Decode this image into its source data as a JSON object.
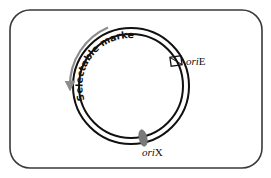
{
  "diagram": {
    "type": "plasmid-map",
    "frame": {
      "stroke": "#3a3a3a",
      "corner_radius": 20
    },
    "plasmid": {
      "center": [
        131,
        86
      ],
      "outer_radius": 58,
      "inner_radius": 52,
      "ring_color": "#111111"
    },
    "features": {
      "selectable_marker": {
        "label": "Selectable marker",
        "arrow_color": "#8c8c8c",
        "text_color": "#111111"
      },
      "oriE": {
        "label_italic": "ori",
        "label_suffix": "E",
        "marker_shape": "box",
        "marker_stroke": "#111111"
      },
      "oriX": {
        "label_italic": "ori",
        "label_suffix": "X",
        "marker_shape": "ellipse",
        "marker_fill": "#7a7a7a"
      }
    }
  }
}
